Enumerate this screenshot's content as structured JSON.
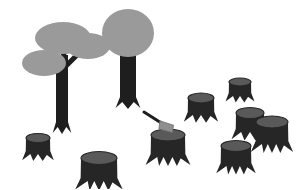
{
  "scene": {
    "title": "Deforestation illustration",
    "caption": "Two remaining trees beside an axe stuck in a stump and eight cut tree stumps",
    "background_color": "#ffffff",
    "width": 306,
    "height": 189
  },
  "palette": {
    "canopy_gray": "#9a9a9a",
    "trunk_dark": "#1e1e1e",
    "stump_body": "#262626",
    "stump_top": "#595959",
    "axe_head": "#8f8f8f",
    "axe_handle": "#1e1e1e",
    "background": "#ffffff"
  },
  "trees": [
    {
      "name": "multi-branch-tree",
      "label": "Tree with three branch canopies",
      "trunk": {
        "x": 62,
        "top": 55,
        "bottom": 128,
        "width": 12
      },
      "canopies": [
        {
          "cx": 63,
          "cy": 38,
          "rx": 28,
          "ry": 16,
          "label": "upper-left canopy"
        },
        {
          "cx": 44,
          "cy": 63,
          "rx": 22,
          "ry": 13,
          "label": "lower-left canopy"
        },
        {
          "cx": 88,
          "cy": 46,
          "rx": 22,
          "ry": 13,
          "label": "right canopy"
        }
      ],
      "branches": [
        {
          "from": [
            62,
            78
          ],
          "to": [
            50,
            62
          ],
          "label": "left branch"
        },
        {
          "from": [
            62,
            70
          ],
          "to": [
            82,
            50
          ],
          "label": "right branch"
        },
        {
          "from": [
            62,
            62
          ],
          "to": [
            66,
            44
          ],
          "label": "center branch"
        }
      ]
    },
    {
      "name": "round-canopy-tree",
      "label": "Tree with round canopy",
      "trunk": {
        "x": 128,
        "top": 48,
        "bottom": 103,
        "width": 16
      },
      "canopies": [
        {
          "cx": 128,
          "cy": 33,
          "rx": 26,
          "ry": 24,
          "label": "round canopy"
        }
      ],
      "branches": []
    }
  ],
  "axe": {
    "name": "axe",
    "label": "Axe embedded in stump",
    "handle": {
      "from": [
        144,
        112
      ],
      "to": [
        166,
        126
      ],
      "width": 3
    },
    "head": {
      "cx": 167,
      "cy": 127,
      "w": 13,
      "h": 10
    },
    "embedded_in_stump_index": 3
  },
  "stumps": [
    {
      "name": "stump-left-lower",
      "label": "Small stump, lower left",
      "cx": 38,
      "cy": 138,
      "rx": 12,
      "ry": 4.5,
      "h": 17,
      "roots": 4
    },
    {
      "name": "stump-bottom-center",
      "label": "Large stump, bottom center",
      "cx": 99,
      "cy": 158,
      "rx": 18,
      "ry": 6.5,
      "h": 24,
      "roots": 5
    },
    {
      "name": "stump-center-axe",
      "label": "Stump with axe embedded",
      "cx": 168,
      "cy": 135,
      "rx": 17,
      "ry": 6,
      "h": 23,
      "roots": 5
    },
    {
      "name": "stump-mid-right",
      "label": "Stump, middle right",
      "cx": 201,
      "cy": 98,
      "rx": 13,
      "ry": 5,
      "h": 18,
      "roots": 4
    },
    {
      "name": "stump-top-right",
      "label": "Small stump, top right",
      "cx": 240,
      "cy": 82,
      "rx": 11,
      "ry": 4,
      "h": 15,
      "roots": 4
    },
    {
      "name": "stump-right-back",
      "label": "Stump, right cluster back",
      "cx": 250,
      "cy": 113,
      "rx": 14,
      "ry": 5.5,
      "h": 20,
      "roots": 4
    },
    {
      "name": "stump-right-front",
      "label": "Stump, right cluster front",
      "cx": 272,
      "cy": 122,
      "rx": 16,
      "ry": 6,
      "h": 23,
      "roots": 5
    },
    {
      "name": "stump-bottom-right",
      "label": "Stump, bottom right",
      "cx": 236,
      "cy": 146,
      "rx": 15,
      "ry": 5.5,
      "h": 21,
      "roots": 5
    }
  ]
}
